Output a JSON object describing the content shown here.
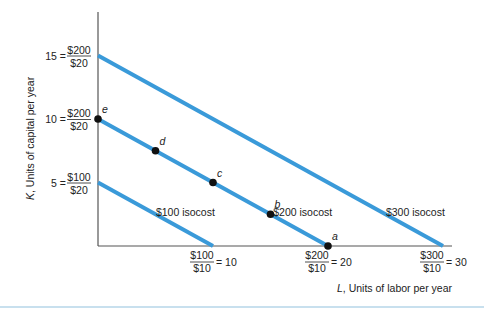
{
  "chart_data": {
    "type": "line",
    "title": "",
    "xlabel_var": "L",
    "xlabel_rest": ", Units of labor per year",
    "ylabel_var": "K",
    "ylabel_rest": ", Units of capital per year",
    "xlim": [
      0,
      32
    ],
    "ylim": [
      0,
      17
    ],
    "line_color": "#3a9ad9",
    "series": [
      {
        "name": "$100 isocost",
        "label": "$100 isocost",
        "x": [
          0,
          10
        ],
        "y": [
          5,
          0
        ]
      },
      {
        "name": "$200 isocost",
        "label": "$200 isocost",
        "x": [
          0,
          20
        ],
        "y": [
          10,
          0
        ]
      },
      {
        "name": "$300 isocost",
        "label": "$300 isocost",
        "x": [
          0,
          30
        ],
        "y": [
          15,
          0
        ]
      }
    ],
    "points": [
      {
        "label": "e",
        "x": 0,
        "y": 10
      },
      {
        "label": "d",
        "x": 5,
        "y": 7.5
      },
      {
        "label": "c",
        "x": 10,
        "y": 5
      },
      {
        "label": "b",
        "x": 15,
        "y": 2.5
      },
      {
        "label": "a",
        "x": 20,
        "y": 0
      }
    ],
    "y_ticks": [
      {
        "value": 15,
        "prefix": "15 =",
        "num": "$200",
        "den": "$20"
      },
      {
        "value": 10,
        "prefix": "10 =",
        "num": "$200",
        "den": "$20"
      },
      {
        "value": 5,
        "prefix": "5 =",
        "num": "$100",
        "den": "$20"
      }
    ],
    "x_ticks": [
      {
        "value": 10,
        "num": "$100",
        "den": "$10",
        "suffix": "= 10"
      },
      {
        "value": 20,
        "num": "$200",
        "den": "$10",
        "suffix": "= 20"
      },
      {
        "value": 30,
        "num": "$300",
        "den": "$10",
        "suffix": "= 30"
      }
    ]
  }
}
